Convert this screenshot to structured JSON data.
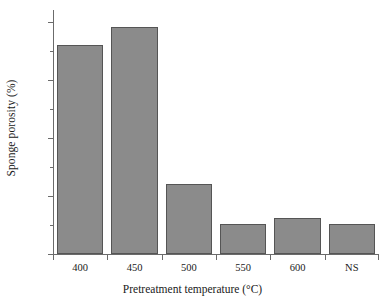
{
  "chart_data": {
    "type": "bar",
    "title": "",
    "subtitle": "",
    "xlabel": "Pretreatment temperature (°C)",
    "ylabel": "Sponge porosity (%)",
    "categories": [
      "400",
      "450",
      "500",
      "550",
      "600",
      "NS"
    ],
    "values": [
      36,
      39,
      12,
      5.2,
      6.2,
      5.2
    ],
    "series": [
      {
        "name": "Sponge porosity",
        "values": [
          36,
          39,
          12,
          5.2,
          6.2,
          5.2
        ]
      }
    ],
    "ylim": [
      0,
      42
    ],
    "xlim": [
      0,
      6
    ],
    "y_major_ticks": [
      0,
      10,
      20,
      30,
      40
    ],
    "y_minor_ticks": [
      5,
      15,
      25,
      35
    ],
    "y_tick_labels": [
      "0",
      "10",
      "20",
      "30",
      "40"
    ],
    "grid": false,
    "legend": null,
    "legend_position": "none",
    "bar_color": "#8b8b8b",
    "bar_edge_color": "#555555",
    "axis_color": "#6b6b6b",
    "text_color": "#1a1a1a",
    "background_color": "#ffffff",
    "annotations": []
  }
}
